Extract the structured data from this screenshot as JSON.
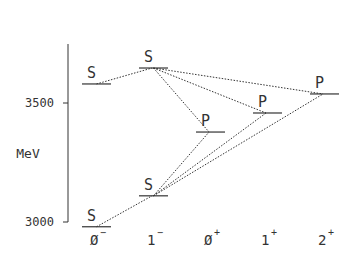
{
  "diagram": {
    "title": "",
    "y_axis": {
      "unit_label": "MeV",
      "ticks": [
        {
          "label": "3000",
          "value": 3000
        },
        {
          "label": "3500",
          "value": 3500
        }
      ],
      "range": [
        2980,
        3660
      ]
    },
    "columns": [
      {
        "id": "0m",
        "label": "0",
        "sup": "−"
      },
      {
        "id": "1m",
        "label": "1",
        "sup": "−"
      },
      {
        "id": "0p",
        "label": "0",
        "sup": "+"
      },
      {
        "id": "1p",
        "label": "1",
        "sup": "+"
      },
      {
        "id": "2p",
        "label": "2",
        "sup": "+"
      }
    ],
    "levels": [
      {
        "id": "s0m_low",
        "column": "0m",
        "label": "S",
        "energy": 2980
      },
      {
        "id": "s0m_high",
        "column": "0m",
        "label": "S",
        "energy": 3580
      },
      {
        "id": "s1m_low",
        "column": "1m",
        "label": "S",
        "energy": 3110
      },
      {
        "id": "s1m_high",
        "column": "1m",
        "label": "S",
        "energy": 3647
      },
      {
        "id": "p0p",
        "column": "0p",
        "label": "P",
        "energy": 3378
      },
      {
        "id": "p1p",
        "column": "1p",
        "label": "P",
        "energy": 3458
      },
      {
        "id": "p2p",
        "column": "2p",
        "label": "P",
        "energy": 3538
      }
    ],
    "transitions": [
      {
        "from": "s0m_low",
        "to": "s1m_low"
      },
      {
        "from": "s0m_high",
        "to": "s1m_high"
      },
      {
        "from": "s1m_high",
        "to": "p0p"
      },
      {
        "from": "s1m_high",
        "to": "p1p"
      },
      {
        "from": "s1m_high",
        "to": "p2p"
      },
      {
        "from": "s1m_low",
        "to": "p0p"
      },
      {
        "from": "s1m_low",
        "to": "p1p"
      },
      {
        "from": "s1m_low",
        "to": "p2p"
      }
    ]
  }
}
